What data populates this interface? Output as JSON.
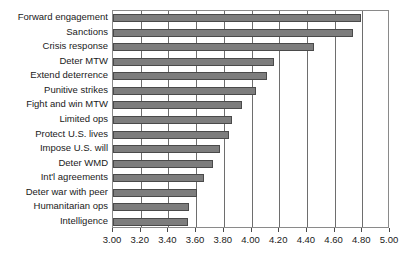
{
  "chart_data": {
    "type": "bar",
    "orientation": "horizontal",
    "title": "",
    "xlabel": "",
    "ylabel": "",
    "xlim": [
      3.0,
      5.0
    ],
    "xtick_step": 0.2,
    "grid": true,
    "legend": null,
    "bar_color": "#7d7d7d",
    "bar_edge_color": "#4a4a4a",
    "axis_color": "#8a8a8a",
    "categories": [
      "Forward engagement",
      "Sanctions",
      "Crisis response",
      "Deter MTW",
      "Extend deterrence",
      "Punitive strikes",
      "Fight and win MTW",
      "Limited ops",
      "Protect U.S. lives",
      "Impose U.S. will",
      "Deter WMD",
      "Int'l agreements",
      "Deter war with peer",
      "Humanitarian ops",
      "Intelligence"
    ],
    "values": [
      4.79,
      4.73,
      4.45,
      4.16,
      4.11,
      4.03,
      3.93,
      3.86,
      3.84,
      3.77,
      3.72,
      3.66,
      3.61,
      3.55,
      3.54
    ],
    "xticks": [
      3.0,
      3.2,
      3.4,
      3.6,
      3.8,
      4.0,
      4.2,
      4.4,
      4.6,
      4.8,
      5.0
    ],
    "xticklabels": [
      "3.00",
      "3.20",
      "3.40",
      "3.60",
      "3.80",
      "4.00",
      "4.20",
      "4.40",
      "4.60",
      "4.80",
      "5.00"
    ]
  }
}
